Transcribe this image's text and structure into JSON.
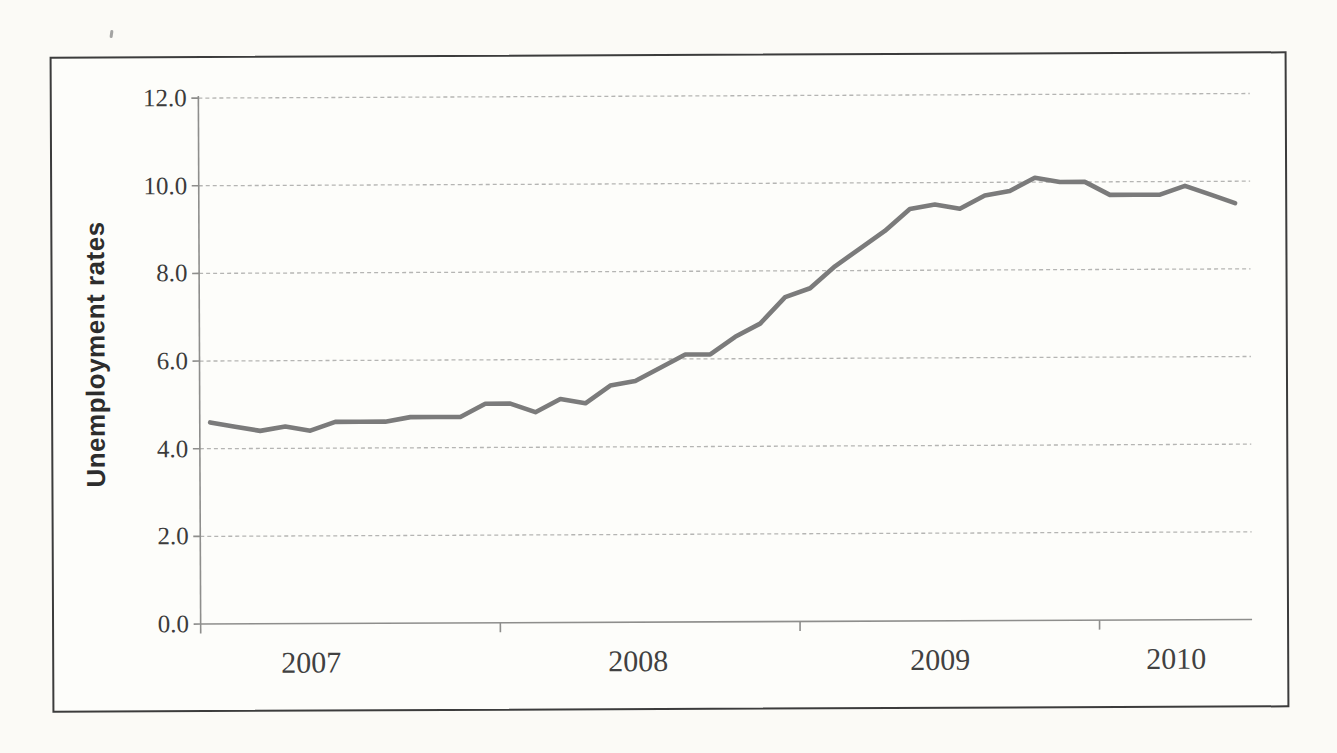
{
  "figure": {
    "y_axis_title": "Unemployment rates"
  },
  "chart_data": {
    "type": "line",
    "title": "",
    "xlabel": "",
    "ylabel": "Unemployment rates",
    "ylim": [
      0,
      12
    ],
    "y_tick_labels": [
      "12.0",
      "10.0",
      "8.0",
      "6.0",
      "4.0",
      "2.0",
      "0.0"
    ],
    "x_year_labels": [
      "2007",
      "2008",
      "2009",
      "2010"
    ],
    "grid": "horizontal dashed gridlines at every 2.0",
    "legend": "none",
    "x": [
      "2007-01",
      "2007-02",
      "2007-03",
      "2007-04",
      "2007-05",
      "2007-06",
      "2007-07",
      "2007-08",
      "2007-09",
      "2007-10",
      "2007-11",
      "2007-12",
      "2008-01",
      "2008-02",
      "2008-03",
      "2008-04",
      "2008-05",
      "2008-06",
      "2008-07",
      "2008-08",
      "2008-09",
      "2008-10",
      "2008-11",
      "2008-12",
      "2009-01",
      "2009-02",
      "2009-03",
      "2009-04",
      "2009-05",
      "2009-06",
      "2009-07",
      "2009-08",
      "2009-09",
      "2009-10",
      "2009-11",
      "2009-12",
      "2010-01",
      "2010-02",
      "2010-03",
      "2010-04",
      "2010-05",
      "2010-06"
    ],
    "series": [
      {
        "name": "Unemployment rate",
        "color": "#7b7b7b",
        "values": [
          4.6,
          4.5,
          4.4,
          4.5,
          4.4,
          4.6,
          4.6,
          4.6,
          4.7,
          4.7,
          4.7,
          5.0,
          5.0,
          4.8,
          5.1,
          5.0,
          5.4,
          5.5,
          5.8,
          6.1,
          6.1,
          6.5,
          6.8,
          7.4,
          7.6,
          8.1,
          8.5,
          8.9,
          9.4,
          9.5,
          9.4,
          9.7,
          9.8,
          10.1,
          10.0,
          10.0,
          9.7,
          9.7,
          9.7,
          9.9,
          9.7,
          9.5
        ]
      }
    ]
  }
}
